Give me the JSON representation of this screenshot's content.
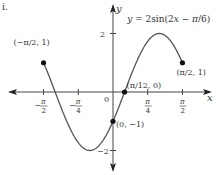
{
  "problem_label": "i.",
  "chart_data": {
    "type": "line",
    "title": "y = 2sin(2x − π/6)",
    "function": {
      "amplitude": 2,
      "frequency": 2,
      "phase_shift": 0.5235987756
    },
    "domain": [
      -1.5707963,
      1.5707963
    ],
    "xlabel": "x",
    "ylabel": "y",
    "xlim": [
      -2.3,
      2.3
    ],
    "ylim": [
      -2.8,
      3.1
    ],
    "x_ticks": [
      {
        "value": -1.5707963,
        "num": "π",
        "den": "2",
        "neg": true
      },
      {
        "value": -0.7853982,
        "num": "π",
        "den": "4",
        "neg": true
      },
      {
        "value": 0.7853982,
        "num": "π",
        "den": "4",
        "neg": false
      },
      {
        "value": 1.5707963,
        "num": "π",
        "den": "2",
        "neg": false
      }
    ],
    "y_ticks": [
      {
        "value": 2,
        "label": "2"
      },
      {
        "value": -2,
        "label": "−2"
      }
    ],
    "origin_label": "0",
    "points": [
      {
        "x": -1.5707963,
        "y": 1,
        "label": "(−π/2, 1)"
      },
      {
        "x": 0.2617994,
        "y": 0,
        "label": "(π/12, 0)"
      },
      {
        "x": 0,
        "y": -1,
        "label": "(0, −1)"
      },
      {
        "x": 1.5707963,
        "y": 1,
        "label": "(π/2, 1)"
      }
    ],
    "grid": false,
    "line_color": "#555555"
  }
}
